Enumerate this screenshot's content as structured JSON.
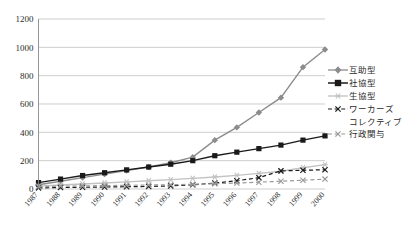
{
  "chart_data": {
    "type": "line",
    "title": "",
    "xlabel": "",
    "ylabel": "",
    "ylim": [
      0,
      1200
    ],
    "ytick_values": [
      0,
      200,
      400,
      600,
      800,
      1000,
      1200
    ],
    "grid": true,
    "legend_position": "right",
    "categories": [
      "1987",
      "1988",
      "1989",
      "1990",
      "1991",
      "1992",
      "1993",
      "1994",
      "1995",
      "1996",
      "1997",
      "1998",
      "1999",
      "2000"
    ],
    "series": [
      {
        "name": "互助型",
        "marker": "diamond",
        "color": "#8c8c8c",
        "dash": "solid",
        "values": [
          30,
          55,
          80,
          105,
          130,
          155,
          185,
          225,
          345,
          435,
          540,
          645,
          860,
          985
        ]
      },
      {
        "name": "社協型",
        "marker": "square",
        "color": "#1a1a1a",
        "dash": "solid",
        "values": [
          45,
          70,
          95,
          115,
          135,
          155,
          175,
          200,
          235,
          260,
          285,
          310,
          345,
          375
        ]
      },
      {
        "name": "生協型",
        "marker": "asterisk",
        "color": "#c2c2c2",
        "dash": "solid",
        "values": [
          20,
          28,
          35,
          42,
          50,
          58,
          66,
          75,
          85,
          96,
          110,
          125,
          150,
          172
        ]
      },
      {
        "name": "ワーカーズコレクティブ",
        "marker": "x",
        "color": "#1a1a1a",
        "dash": "dashed",
        "values": [
          8,
          10,
          12,
          14,
          16,
          18,
          22,
          30,
          42,
          58,
          80,
          128,
          132,
          136
        ]
      },
      {
        "name": "行政関与",
        "marker": "x",
        "color": "#9a9a9a",
        "dash": "dashed",
        "values": [
          18,
          20,
          22,
          24,
          26,
          28,
          30,
          33,
          37,
          42,
          48,
          55,
          62,
          70
        ]
      }
    ],
    "legend_entries": [
      {
        "label": "互助型"
      },
      {
        "label": "社協型"
      },
      {
        "label": "生協型"
      },
      {
        "label": "ワーカーズ",
        "label_cont": "コレクティブ"
      },
      {
        "label": "行政関与"
      }
    ]
  }
}
